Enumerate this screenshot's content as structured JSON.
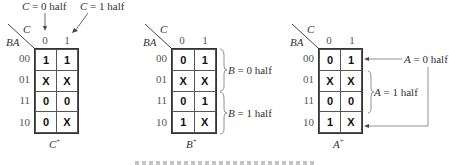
{
  "maps": [
    {
      "id": "c-plus",
      "title": "C",
      "title_sup": "+",
      "row_var": "BA",
      "col_var": "C",
      "col_labels": [
        "0",
        "1"
      ],
      "row_labels": [
        "00",
        "01",
        "11",
        "10"
      ],
      "cells": [
        [
          "1",
          "1"
        ],
        [
          "X",
          "X"
        ],
        [
          "0",
          "0"
        ],
        [
          "0",
          "X"
        ]
      ]
    },
    {
      "id": "b-plus",
      "title": "B",
      "title_sup": "+",
      "row_var": "BA",
      "col_var": "C",
      "col_labels": [
        "0",
        "1"
      ],
      "row_labels": [
        "00",
        "01",
        "11",
        "10"
      ],
      "cells": [
        [
          "0",
          "1"
        ],
        [
          "X",
          "X"
        ],
        [
          "0",
          "1"
        ],
        [
          "1",
          "X"
        ]
      ]
    },
    {
      "id": "a-plus",
      "title": "A",
      "title_sup": "+",
      "row_var": "BA",
      "col_var": "C",
      "col_labels": [
        "0",
        "1"
      ],
      "row_labels": [
        "00",
        "01",
        "11",
        "10"
      ],
      "cells": [
        [
          "0",
          "1"
        ],
        [
          "X",
          "X"
        ],
        [
          "0",
          "0"
        ],
        [
          "1",
          "X"
        ]
      ]
    }
  ],
  "annotations": {
    "c0_var": "C",
    "c0_text": " = 0 half",
    "c1_var": "C",
    "c1_text": " = 1 half",
    "b0_var": "B",
    "b0_text": " = 0 half",
    "b1_var": "B",
    "b1_text": " = 1 half",
    "a0_var": "A",
    "a0_text": " = 0 half",
    "a1_var": "A",
    "a1_text": " = 1 half"
  }
}
